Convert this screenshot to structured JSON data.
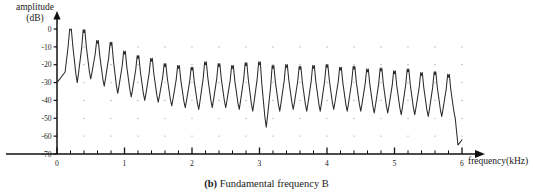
{
  "figure": {
    "caption_prefix": "(b)",
    "caption_text": "Fundamental frequency B",
    "y_axis_label_line1": "amplitude",
    "y_axis_label_line2": "(dB)",
    "x_axis_label": "frequency(kHz)"
  },
  "chart_data": {
    "type": "line",
    "title": "(b) Fundamental frequency B",
    "xlabel": "frequency(kHz)",
    "ylabel": "amplitude (dB)",
    "xlim": [
      0,
      6.0
    ],
    "ylim": [
      -70,
      0
    ],
    "xticks": [
      0,
      1,
      2,
      3,
      4,
      5,
      6
    ],
    "xtick_labels": [
      "0",
      "1",
      "2",
      "3",
      "4",
      "5",
      "6"
    ],
    "xminor_step": 0.2,
    "yticks": [
      0,
      -10,
      -20,
      -30,
      -40,
      -50,
      -60,
      -70
    ],
    "ytick_labels": [
      "0",
      "-10",
      "-20",
      "-30",
      "-40",
      "-50",
      "-60",
      "-70"
    ],
    "grid": "dotted-point-grid",
    "grid_x_step": 0.4,
    "grid_y_step": 10,
    "legend": null,
    "series": [
      {
        "name": "spectrum B",
        "description": "Harmonic spectrum: comb of peaks spaced at the fundamental frequency, decaying from 0 dB toward -40 dB, ending with a drop to -65 dB.",
        "fundamental_khz": 0.2,
        "n_peaks": 29,
        "peak_frequencies_khz": [
          0.2,
          0.4,
          0.6,
          0.8,
          1.0,
          1.2,
          1.4,
          1.6,
          1.8,
          2.0,
          2.2,
          2.4,
          2.6,
          2.8,
          3.0,
          3.2,
          3.4,
          3.6,
          3.8,
          4.0,
          4.2,
          4.4,
          4.6,
          4.8,
          5.0,
          5.2,
          5.4,
          5.6,
          5.8
        ],
        "peak_amplitudes_db": [
          -0.5,
          -2.0,
          -8.0,
          -9.0,
          -14.0,
          -16.5,
          -18.0,
          -21.0,
          -22.0,
          -23.0,
          -20.0,
          -21.0,
          -22.0,
          -20.5,
          -20.0,
          -22.0,
          -21.5,
          -22.5,
          -22.0,
          -21.5,
          -23.0,
          -22.5,
          -24.0,
          -23.5,
          -25.0,
          -24.0,
          -26.0,
          -25.5,
          -27.0
        ],
        "valley_amplitudes_db": [
          -30.0,
          -28.0,
          -32.0,
          -36.0,
          -38.0,
          -40.0,
          -41.0,
          -43.0,
          -44.0,
          -45.0,
          -44.0,
          -44.0,
          -45.0,
          -46.0,
          -55.0,
          -46.0,
          -45.0,
          -46.0,
          -46.0,
          -45.0,
          -46.0,
          -46.0,
          -47.0,
          -47.0,
          -48.0,
          -48.0,
          -49.0,
          -49.0,
          -50.0
        ],
        "start_amplitude_db": -30.0,
        "end_amplitude_db": -65.0,
        "end_frequency_khz": 6.0
      }
    ]
  }
}
